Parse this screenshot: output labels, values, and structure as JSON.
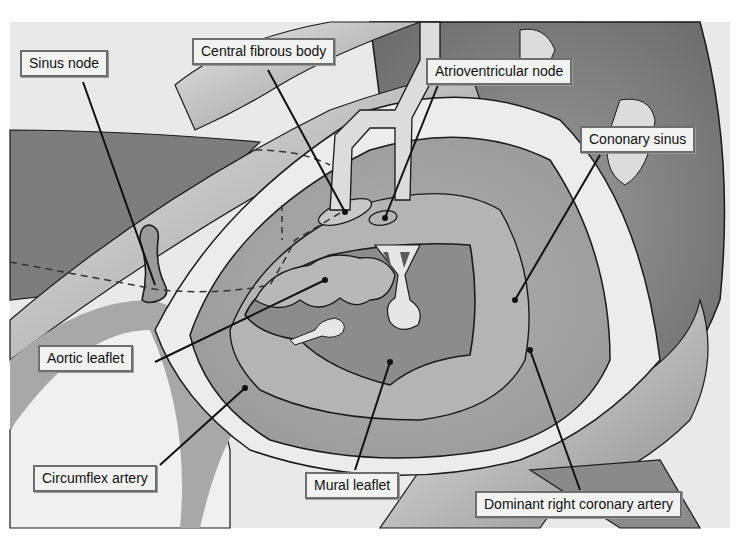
{
  "figure": {
    "colors": {
      "background": "#ffffff",
      "dark_tissue": "#7a7a7a",
      "mid_tissue": "#a6a6a6",
      "light_tissue": "#d9d9d9",
      "outline": "#1a1a1a",
      "label_fill": "#f2f2f2",
      "label_border": "#6e6e6e"
    }
  },
  "labels": [
    {
      "id": "sinus-node",
      "text": "Sinus node"
    },
    {
      "id": "central-fibrous-body",
      "text": "Central fibrous body"
    },
    {
      "id": "atrioventricular-node",
      "text": "Atrioventricular node"
    },
    {
      "id": "coronary-sinus",
      "text": "Cononary sinus"
    },
    {
      "id": "aortic-leaflet",
      "text": "Aortic leaflet"
    },
    {
      "id": "circumflex-artery",
      "text": "Circumflex artery"
    },
    {
      "id": "mural-leaflet",
      "text": "Mural leaflet"
    },
    {
      "id": "dominant-right-coronary-artery",
      "text": "Dominant right coronary artery"
    }
  ]
}
